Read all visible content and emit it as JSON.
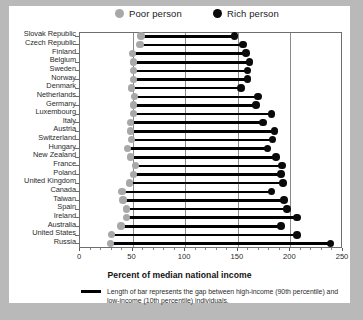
{
  "legend": {
    "entries": [
      {
        "label": "Poor person",
        "color": "#a8a8a8",
        "icon": "gray-filled-circle"
      },
      {
        "label": "Rich person",
        "color": "#0a0a0a",
        "icon": "black-filled-circle"
      }
    ]
  },
  "axis": {
    "x_title": "Percent of median national income",
    "ticks": [
      0,
      50,
      100,
      150,
      200,
      250
    ]
  },
  "footnote": {
    "text": "Length of bar represents the gap between high-income (90th percentile) and low-income (10th percentile) individuals."
  },
  "chart_data": {
    "type": "bar",
    "subtype": "dumbbell-range-bar",
    "title": "",
    "xlabel": "Percent of median national income",
    "ylabel": "",
    "xlim": [
      0,
      250
    ],
    "xticks": [
      0,
      50,
      100,
      150,
      200,
      250
    ],
    "grid": "vertical-at-50-100-150-200",
    "legend": [
      "Poor person",
      "Rich person"
    ],
    "legend_position": "top",
    "categories": [
      "Slovak Republic",
      "Czech Republic",
      "Finland",
      "Belgium",
      "Sweden",
      "Norway",
      "Denmark",
      "Netherlands",
      "Germany",
      "Luxembourg",
      "Italy",
      "Austria",
      "Switzerland",
      "Hungary",
      "New Zealand",
      "France",
      "Poland",
      "United Kingdom",
      "Canada",
      "Taiwan",
      "Spain",
      "Ireland",
      "Australia",
      "United States",
      "Russia"
    ],
    "series": [
      {
        "name": "Poor person",
        "note": "10th percentile income as percent of median national income",
        "values": [
          59,
          58,
          51,
          52,
          52,
          52,
          50,
          53,
          52,
          52,
          49,
          49,
          50,
          46,
          49,
          54,
          52,
          48,
          41,
          42,
          45,
          45,
          40,
          31,
          30
        ]
      },
      {
        "name": "Rich person",
        "note": "90th percentile income as percent of median national income",
        "values": [
          148,
          156,
          159,
          162,
          160,
          160,
          154,
          170,
          168,
          183,
          175,
          186,
          184,
          179,
          187,
          193,
          192,
          194,
          183,
          195,
          198,
          207,
          192,
          207,
          239
        ]
      }
    ]
  }
}
